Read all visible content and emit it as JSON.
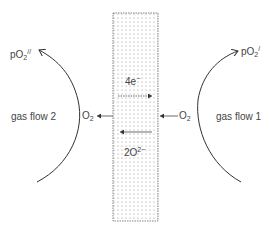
{
  "diagram": {
    "membrane": {
      "fill_dots": true,
      "border_color": "#555555"
    },
    "left_side": {
      "pressure_label": {
        "base": "pO",
        "sub": "2",
        "sup": "//"
      },
      "flow_label": "gas flow 2",
      "gas_label": {
        "base": "O",
        "sub": "2"
      }
    },
    "right_side": {
      "pressure_label": {
        "base": "pO",
        "sub": "2",
        "sup": "/"
      },
      "flow_label": "gas flow 1",
      "gas_label": {
        "base": "O",
        "sub": "2"
      }
    },
    "electron_label": {
      "base": "4e",
      "sup": "−"
    },
    "ion_label": {
      "base": "2O",
      "sup": "2−"
    },
    "colors": {
      "line": "#333333",
      "dots": "#999999"
    }
  }
}
